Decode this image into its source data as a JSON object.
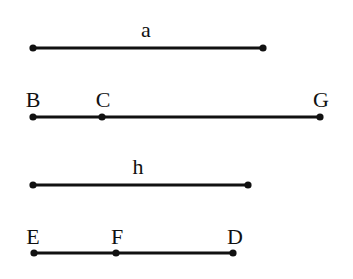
{
  "style": {
    "line_color": "#111111",
    "background": "#ffffff"
  },
  "segments": [
    {
      "id": "a",
      "label": "a",
      "label_pos": [
        146,
        30
      ],
      "y": 48,
      "x1": 33,
      "x2": 263,
      "points": [
        {
          "name": "",
          "x": 33
        },
        {
          "name": "",
          "x": 263
        }
      ]
    },
    {
      "id": "BG",
      "label": "",
      "y": 117,
      "x1": 33,
      "x2": 320,
      "points": [
        {
          "name": "B",
          "x": 33,
          "label_pos": [
            33,
            100
          ]
        },
        {
          "name": "C",
          "x": 102,
          "label_pos": [
            103,
            100
          ]
        },
        {
          "name": "G",
          "x": 320,
          "label_pos": [
            321,
            100
          ]
        }
      ]
    },
    {
      "id": "h",
      "label": "h",
      "label_pos": [
        138,
        167
      ],
      "y": 185,
      "x1": 33,
      "x2": 248,
      "points": [
        {
          "name": "",
          "x": 33
        },
        {
          "name": "",
          "x": 248
        }
      ]
    },
    {
      "id": "ED",
      "label": "",
      "y": 253,
      "x1": 34,
      "x2": 233,
      "points": [
        {
          "name": "E",
          "x": 34,
          "label_pos": [
            33,
            237
          ]
        },
        {
          "name": "F",
          "x": 116,
          "label_pos": [
            117,
            237
          ]
        },
        {
          "name": "D",
          "x": 233,
          "label_pos": [
            235,
            237
          ]
        }
      ]
    }
  ],
  "labels": {
    "a": "a",
    "B": "B",
    "C": "C",
    "G": "G",
    "h": "h",
    "E": "E",
    "F": "F",
    "D": "D"
  }
}
